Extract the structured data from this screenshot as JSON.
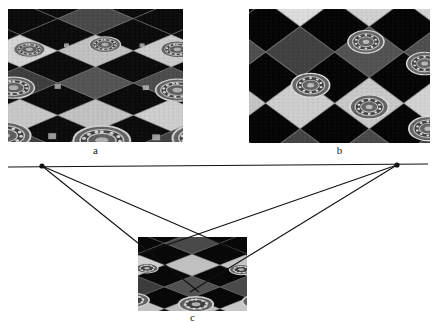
{
  "figure": {
    "top_strip_text": "· · · · · · · · · · · ·",
    "panels": [
      {
        "id": "a",
        "caption": "a",
        "description": "perspective photograph of an ornate tiled floor with diamond checkerboard and circular rosette medallions"
      },
      {
        "id": "b",
        "caption": "b",
        "description": "affine / perspective rectification of the tiled floor, dark triangular unmapped region at lower left"
      },
      {
        "id": "c",
        "caption": "c",
        "description": "small copy of the tiled floor photograph used as the imaging plane of the vanishing point construction"
      }
    ],
    "diagram": {
      "horizon_label": "",
      "vanishing_points": [
        {
          "name": "left-vanishing-point",
          "x": 42,
          "y": 11
        },
        {
          "name": "right-vanishing-point",
          "x": 397,
          "y": 10
        }
      ],
      "horizon_line": {
        "x1": 8,
        "y1": 12,
        "x2": 428,
        "y2": 9
      },
      "rays": [
        {
          "from": "left-vanishing-point",
          "x1": 42,
          "y1": 11,
          "x2": 247,
          "y2": 100
        },
        {
          "from": "left-vanishing-point",
          "x1": 42,
          "y1": 11,
          "x2": 199,
          "y2": 137
        },
        {
          "from": "right-vanishing-point",
          "x1": 397,
          "y1": 10,
          "x2": 138,
          "y2": 100
        },
        {
          "from": "right-vanishing-point",
          "x1": 397,
          "y1": 10,
          "x2": 190,
          "y2": 137
        }
      ],
      "point_radius": 2.6,
      "line_color": "#111111",
      "line_width": 1.1
    },
    "colors": {
      "background": "#ffffff",
      "ink": "#111111",
      "caption": "#1a1a1a",
      "tile_dark": "#151515",
      "tile_mid": "#4a4a4a",
      "tile_light": "#cfcfcf",
      "rosette": "#9a9a9a"
    }
  }
}
